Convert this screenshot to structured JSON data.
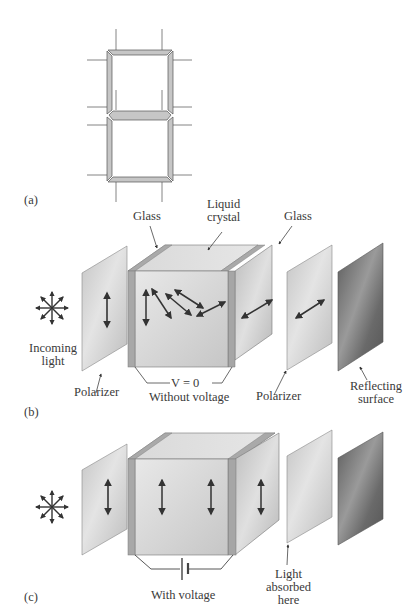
{
  "figure": {
    "panels": [
      {
        "id": "a",
        "label": "(a)",
        "description": "Seven-segment display"
      },
      {
        "id": "b",
        "label": "(b)",
        "caption": "Without voltage",
        "voltage_label": "V = 0"
      },
      {
        "id": "c",
        "label": "(c)",
        "caption": "With voltage"
      }
    ]
  },
  "labels_b": {
    "glass_left": "Glass",
    "liquid_crystal_line1": "Liquid",
    "liquid_crystal_line2": "crystal",
    "glass_right": "Glass",
    "incoming_light_line1": "Incoming",
    "incoming_light_line2": "light",
    "polarizer_left": "Polarizer",
    "voltage": "V = 0",
    "caption": "Without voltage",
    "polarizer_right": "Polarizer",
    "reflecting_line1": "Reflecting",
    "reflecting_line2": "surface",
    "panel": "(b)"
  },
  "labels_c": {
    "caption": "With voltage",
    "absorbed_line1": "Light",
    "absorbed_line2": "absorbed",
    "absorbed_line3": "here",
    "panel": "(c)"
  },
  "labels_a": {
    "panel": "(a)"
  },
  "colors": {
    "segment_fill": "#c8c8c8",
    "panel_light": "#d4d4d4",
    "panel_dark": "#6a6a6a",
    "glass": "#a8a8a8",
    "arrow": "#333333",
    "line": "#555555"
  }
}
